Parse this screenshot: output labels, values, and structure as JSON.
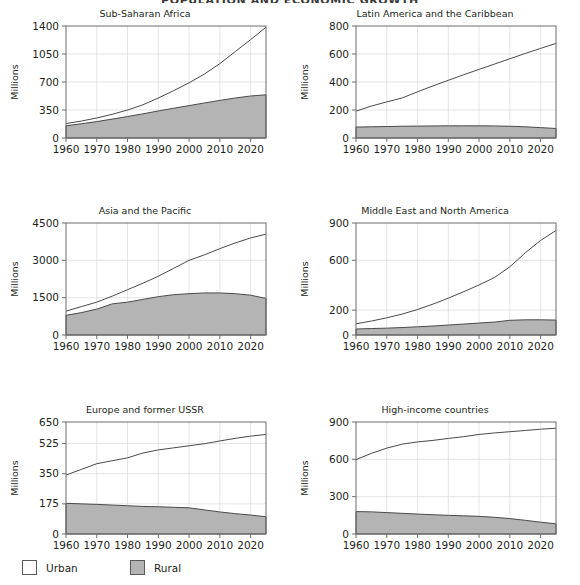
{
  "header": {
    "running_head": "POPULATION AND ECONOMIC GROWTH"
  },
  "legend": {
    "items": [
      {
        "name": "urban",
        "label": "Urban",
        "color": "#ffffff"
      },
      {
        "name": "rural",
        "label": "Rural",
        "color": "#b4b4b4"
      }
    ]
  },
  "axis_label": "Millions",
  "chart_data": [
    {
      "type": "area",
      "panel": 0,
      "title": "Sub-Saharan Africa",
      "xlabel": "",
      "ylabel": "Millions",
      "xlim": [
        1960,
        2025
      ],
      "ylim": [
        0,
        1400
      ],
      "yticks": [
        0,
        350,
        700,
        1050,
        1400
      ],
      "xticks": [
        1960,
        1970,
        1980,
        1990,
        2000,
        2010,
        2020
      ],
      "grid": true,
      "legend_position": "figure-bottom-left",
      "x": [
        1960,
        1965,
        1970,
        1975,
        1980,
        1985,
        1990,
        1995,
        2000,
        2005,
        2010,
        2015,
        2020,
        2025
      ],
      "series": [
        {
          "name": "Rural",
          "kind": "area",
          "values": [
            152,
            178,
            205,
            236,
            268,
            302,
            338,
            372,
            405,
            438,
            470,
            500,
            525,
            540
          ]
        },
        {
          "name": "Total",
          "kind": "line",
          "values": [
            180,
            212,
            250,
            296,
            350,
            415,
            500,
            592,
            690,
            800,
            930,
            1080,
            1230,
            1385
          ]
        }
      ]
    },
    {
      "type": "area",
      "panel": 1,
      "title": "Latin America and the Caribbean",
      "xlabel": "",
      "ylabel": "Millions",
      "xlim": [
        1960,
        2025
      ],
      "ylim": [
        0,
        800
      ],
      "yticks": [
        0,
        200,
        400,
        600,
        800
      ],
      "xticks": [
        1960,
        1970,
        1980,
        1990,
        2000,
        2010,
        2020
      ],
      "grid": true,
      "x": [
        1960,
        1965,
        1970,
        1975,
        1980,
        1985,
        1990,
        1995,
        2000,
        2005,
        2010,
        2015,
        2020,
        2025
      ],
      "series": [
        {
          "name": "Rural",
          "kind": "area",
          "values": [
            78,
            80,
            82,
            84,
            85,
            86,
            87,
            87,
            87,
            86,
            84,
            80,
            74,
            68
          ]
        },
        {
          "name": "Total",
          "kind": "line",
          "values": [
            192,
            228,
            258,
            286,
            330,
            372,
            412,
            452,
            490,
            528,
            566,
            604,
            640,
            676
          ]
        }
      ]
    },
    {
      "type": "area",
      "panel": 2,
      "title": "Asia and the Pacific",
      "xlabel": "",
      "ylabel": "Millions",
      "xlim": [
        1960,
        2025
      ],
      "ylim": [
        0,
        4500
      ],
      "yticks": [
        0,
        1500,
        3000,
        4500
      ],
      "xticks": [
        1960,
        1970,
        1980,
        1990,
        2000,
        2010,
        2020
      ],
      "grid": true,
      "x": [
        1960,
        1965,
        1970,
        1975,
        1980,
        1985,
        1990,
        1995,
        2000,
        2005,
        2010,
        2015,
        2020,
        2025
      ],
      "series": [
        {
          "name": "Rural",
          "kind": "area",
          "values": [
            790,
            900,
            1040,
            1250,
            1320,
            1430,
            1540,
            1620,
            1660,
            1690,
            1690,
            1660,
            1600,
            1470
          ]
        },
        {
          "name": "Total",
          "kind": "line",
          "values": [
            960,
            1140,
            1320,
            1560,
            1820,
            2080,
            2360,
            2680,
            3000,
            3220,
            3470,
            3700,
            3900,
            4050
          ]
        }
      ]
    },
    {
      "type": "area",
      "panel": 3,
      "title": "Middle East and North America",
      "xlabel": "",
      "ylabel": "Millions",
      "xlim": [
        1960,
        2025
      ],
      "ylim": [
        0,
        900
      ],
      "yticks": [
        0,
        200,
        600,
        900
      ],
      "xticks": [
        1960,
        1970,
        1980,
        1990,
        2000,
        2010,
        2020
      ],
      "grid": true,
      "x": [
        1960,
        1965,
        1970,
        1975,
        1980,
        1985,
        1990,
        1995,
        2000,
        2005,
        2010,
        2015,
        2020,
        2025
      ],
      "series": [
        {
          "name": "Rural",
          "kind": "area",
          "values": [
            48,
            52,
            55,
            60,
            66,
            72,
            80,
            88,
            96,
            104,
            118,
            122,
            122,
            120
          ]
        },
        {
          "name": "Total",
          "kind": "line",
          "values": [
            90,
            112,
            138,
            168,
            205,
            248,
            296,
            348,
            402,
            462,
            548,
            660,
            760,
            840
          ]
        }
      ]
    },
    {
      "type": "area",
      "panel": 4,
      "title": "Europe and former USSR",
      "xlabel": "",
      "ylabel": "Millions",
      "xlim": [
        1960,
        2025
      ],
      "ylim": [
        0,
        650
      ],
      "yticks": [
        0,
        175,
        350,
        525,
        650
      ],
      "xticks": [
        1960,
        1970,
        1980,
        1990,
        2000,
        2010,
        2020
      ],
      "grid": true,
      "x": [
        1960,
        1965,
        1970,
        1975,
        1980,
        1985,
        1990,
        1995,
        2000,
        2005,
        2010,
        2015,
        2020,
        2025
      ],
      "series": [
        {
          "name": "Rural",
          "kind": "area",
          "values": [
            178,
            175,
            172,
            168,
            164,
            160,
            158,
            155,
            152,
            140,
            128,
            118,
            110,
            100
          ]
        },
        {
          "name": "Total",
          "kind": "line",
          "values": [
            342,
            375,
            408,
            425,
            442,
            470,
            488,
            500,
            512,
            524,
            540,
            555,
            568,
            578
          ]
        }
      ]
    },
    {
      "type": "area",
      "panel": 5,
      "title": "High-income countries",
      "xlabel": "",
      "ylabel": "Millions",
      "xlim": [
        1960,
        2025
      ],
      "ylim": [
        0,
        900
      ],
      "yticks": [
        0,
        300,
        600,
        900
      ],
      "xticks": [
        1960,
        1970,
        1980,
        1990,
        2000,
        2010,
        2020
      ],
      "grid": true,
      "x": [
        1960,
        1965,
        1970,
        1975,
        1980,
        1985,
        1990,
        1995,
        2000,
        2005,
        2010,
        2015,
        2020,
        2025
      ],
      "series": [
        {
          "name": "Rural",
          "kind": "area",
          "values": [
            180,
            178,
            172,
            166,
            160,
            155,
            150,
            146,
            142,
            134,
            124,
            110,
            95,
            82
          ]
        },
        {
          "name": "Total",
          "kind": "line",
          "values": [
            598,
            648,
            690,
            722,
            740,
            752,
            768,
            782,
            800,
            812,
            822,
            832,
            842,
            850
          ]
        }
      ]
    }
  ]
}
